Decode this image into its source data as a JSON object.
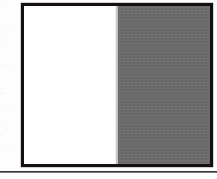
{
  "figure": {
    "name": "two-tone-vertical-swatch",
    "caption": "",
    "border_color": "#15100e",
    "border_width_px": 3,
    "frame": {
      "left_px": 21,
      "top_px": 3,
      "width_px": 192,
      "height_px": 164
    },
    "panels": [
      {
        "id": "left-panel",
        "label": "",
        "fill_color": "#ffffff",
        "tone": "white",
        "width_percent": 50.5
      },
      {
        "id": "right-panel",
        "label": "",
        "fill_color": "#6a6a6a",
        "tone": "gray",
        "width_percent": 49.5
      }
    ],
    "divider": {
      "orientation": "vertical",
      "x_px": 117,
      "color": "#b2b2b2"
    }
  },
  "rule_below": {
    "label": "",
    "color": "#2b2724",
    "y_px": 171,
    "thickness_px": 2,
    "spans_full_width": true
  },
  "page": {
    "background_color": "#fdfdfd",
    "width_px": 217,
    "height_px": 179
  }
}
